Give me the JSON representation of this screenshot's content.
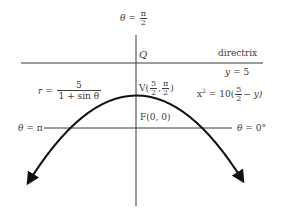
{
  "figure": {
    "type": "polar parabola diagram",
    "labels": {
      "theta_top": {
        "lhs": "θ",
        "eq": "=",
        "num": "π",
        "den": "2"
      },
      "point_q": "Q",
      "directrix": "directrix",
      "directrix_eq": {
        "lhs": "y",
        "eq": "=",
        "rhs": "5"
      },
      "polar_eq": {
        "lhs": "r",
        "eq": "=",
        "num": "5",
        "den": "1 + sin θ"
      },
      "vertex": {
        "name": "V",
        "open": "(",
        "r_num": "5",
        "r_den": "2",
        "sep": ",",
        "t_num": "π",
        "t_den": "2",
        "close": ")"
      },
      "rect_eq": {
        "lhs": "x",
        "exp": "2",
        "eq": "=",
        "coef": "10(",
        "num": "5",
        "den": "2",
        "tail": "− y)"
      },
      "focus": "F(0, 0)",
      "theta_left": {
        "lhs": "θ",
        "eq": "=",
        "rhs": "π"
      },
      "theta_right": {
        "lhs": "θ",
        "eq": "=",
        "rhs": "0°"
      }
    },
    "colors": {
      "line": "#3a3a3a",
      "curve": "#111111",
      "text": "#3a3a3a",
      "background": "#ffffff"
    }
  }
}
